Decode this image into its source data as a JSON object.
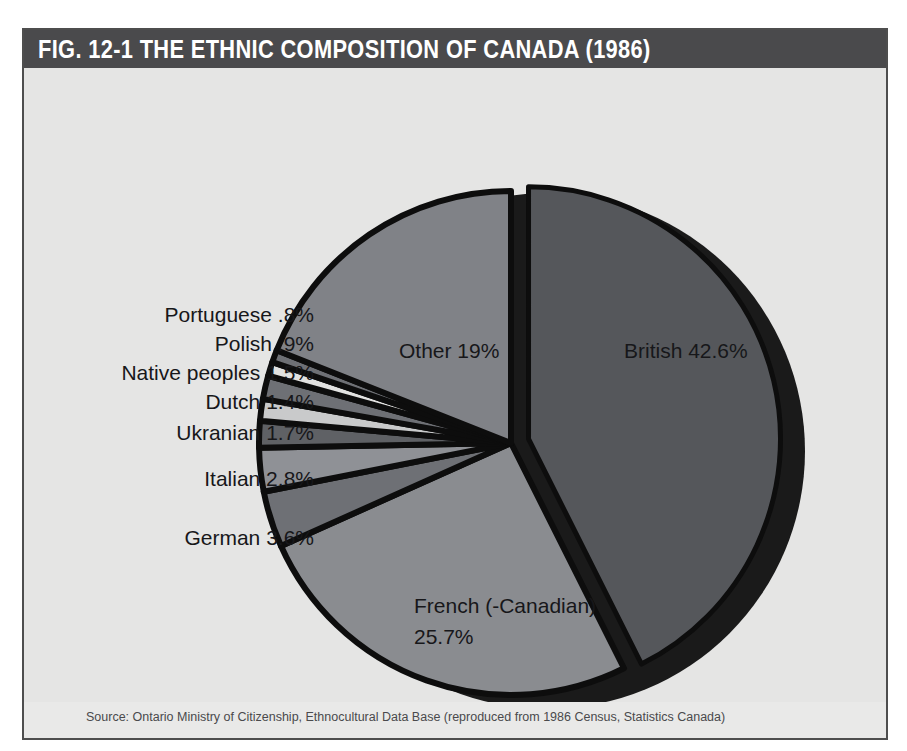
{
  "figure": {
    "title": "FIG. 12-1  THE ETHNIC COMPOSITION OF CANADA (1986)",
    "source": "Source:  Ontario Ministry of Citizenship, Ethnocultural Data Base (reproduced from 1986 Census, Statistics Canada)"
  },
  "labels": {
    "british": "British 42.6%",
    "french_line1": "French (-Canadian)",
    "french_line2": "25.7%",
    "other": "Other 19%",
    "german": "German 3.6%",
    "italian": "Italian 2.8%",
    "ukranian": "Ukranian 1.7%",
    "dutch": "Dutch 1.4%",
    "native": "Native peoples 1.5%",
    "polish": "Polish .9%",
    "portuguese": "Portuguese .8%"
  },
  "colors": {
    "title_bar": "#4a4a4c",
    "panel": "#e5e5e4",
    "frame_border": "#4e4e4e",
    "shadow": "#1a1a1a",
    "slice_outline": "#0d0d0d",
    "british": "#55575b",
    "french": "#8a8c90",
    "other": "#808287",
    "german": "#6e7075",
    "italian": "#8f9196",
    "ukranian": "#5f6165",
    "dutch": "#c9cacb",
    "native": "#6e7075",
    "polish": "#e2e2e1",
    "portuguese": "#6e7075"
  },
  "chart_data": {
    "type": "pie",
    "title": "FIG. 12-1  THE ETHNIC COMPOSITION OF CANADA (1986)",
    "xlabel": "",
    "ylabel": "",
    "legend": "none",
    "note": "Pie begins at 12 o'clock and proceeds clockwise; the British wedge is exploded to the right and cast on a dark drop shadow.",
    "units": "percent",
    "categories": [
      "British",
      "French (-Canadian)",
      "German",
      "Italian",
      "Ukranian",
      "Dutch",
      "Native peoples",
      "Polish",
      "Portuguese",
      "Other"
    ],
    "values": [
      42.6,
      25.7,
      3.6,
      2.8,
      1.7,
      1.4,
      1.5,
      0.9,
      0.8,
      19.0
    ],
    "labels": [
      "British 42.6%",
      "French (-Canadian) 25.7%",
      "German 3.6%",
      "Italian 2.8%",
      "Ukranian 1.7%",
      "Dutch 1.4%",
      "Native peoples 1.5%",
      "Polish .9%",
      "Portuguese .8%",
      "Other 19%"
    ],
    "slice_colors": [
      "#55575b",
      "#8a8c90",
      "#6e7075",
      "#8f9196",
      "#5f6165",
      "#c9cacb",
      "#6e7075",
      "#e2e2e1",
      "#6e7075",
      "#808287"
    ],
    "exploded": [
      "British"
    ],
    "total": 100.0,
    "source": "Source:  Ontario Ministry of Citizenship, Ethnocultural Data Base (reproduced from 1986 Census, Statistics Canada)"
  }
}
